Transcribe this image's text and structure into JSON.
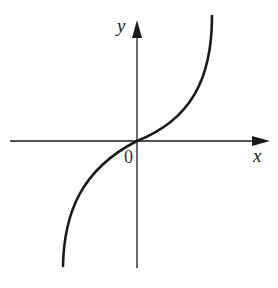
{
  "figure": {
    "type": "function-graph",
    "axes": {
      "x_label": "x",
      "y_label": "y",
      "origin_label": "0",
      "axis_color": "#1a1a1a"
    },
    "curve": {
      "description": "cubic-like curve y = k*x^3 passing through the origin, increasing, concave down for x<0 and concave up for x>0",
      "color": "#1a1a1a"
    }
  }
}
